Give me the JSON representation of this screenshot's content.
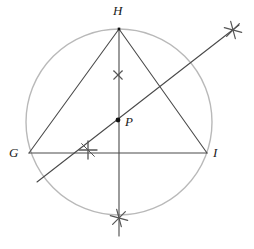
{
  "figure": {
    "width": 254,
    "height": 249,
    "background": "#ffffff"
  },
  "colors": {
    "circle": "#b9b9b9",
    "line": "#4a4a4a",
    "construction_mark": "#555555",
    "label": "#1a1a1a",
    "point": "#111111"
  },
  "labels": {
    "H": "H",
    "G": "G",
    "I": "I",
    "P": "P"
  },
  "geometry": {
    "circumcircle": {
      "cx": 119,
      "cy": 122,
      "r": 93,
      "stroke": "#b9b9b9",
      "stroke_width": 1.4
    },
    "vertices": {
      "H": {
        "x": 119,
        "y": 29
      },
      "G": {
        "x": 29,
        "y": 153
      },
      "I": {
        "x": 207,
        "y": 153
      }
    },
    "point_P": {
      "x": 118,
      "y": 120,
      "radius": 2.4
    },
    "segments": [
      {
        "name": "side-GH",
        "x1": 29,
        "y1": 153,
        "x2": 119,
        "y2": 29
      },
      {
        "name": "side-HI",
        "x1": 119,
        "y1": 29,
        "x2": 207,
        "y2": 153
      },
      {
        "name": "side-GI",
        "x1": 29,
        "y1": 153,
        "x2": 207,
        "y2": 153
      },
      {
        "name": "vertical-bisector",
        "x1": 119,
        "y1": 28,
        "x2": 119,
        "y2": 236
      },
      {
        "name": "oblique-bisector",
        "x1": 37,
        "y1": 182,
        "x2": 239,
        "y2": 25
      }
    ],
    "construction_marks": [
      {
        "name": "arc-mark-upper-x",
        "x": 118,
        "y": 75,
        "type": "x-cross",
        "size": 6
      },
      {
        "name": "arc-mark-left-plus",
        "x": 88,
        "y": 150,
        "type": "plus-cross",
        "size": 9
      },
      {
        "name": "arc-mark-lower-star",
        "x": 119,
        "y": 218,
        "type": "star-6",
        "size": 9
      },
      {
        "name": "arc-mark-upper-right-star",
        "x": 233,
        "y": 30,
        "type": "star-6",
        "size": 9
      }
    ]
  }
}
